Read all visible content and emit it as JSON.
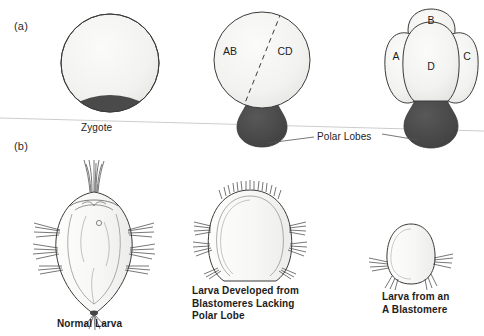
{
  "figure": {
    "panels": [
      {
        "id": "a",
        "label": "(a)"
      },
      {
        "id": "b",
        "label": "(b)"
      }
    ],
    "panel_a": {
      "stages": [
        {
          "name": "zygote",
          "caption": "Zygote",
          "cell_labels": [],
          "has_polar_lobe": true,
          "polar_lobe_style": "crescent"
        },
        {
          "name": "two-cell-stage",
          "caption": "",
          "cell_labels": [
            "AB",
            "CD"
          ],
          "has_polar_lobe": true,
          "polar_lobe_style": "lobe",
          "cleavage_furrow": "dashed"
        },
        {
          "name": "four-cell-stage",
          "caption": "",
          "cell_labels": [
            "A",
            "B",
            "C",
            "D"
          ],
          "has_polar_lobe": true,
          "polar_lobe_style": "lobe"
        }
      ],
      "annotation": {
        "text": "Polar Lobes",
        "leader_lines": 2
      }
    },
    "panel_b": {
      "larvae": [
        {
          "name": "normal-larva",
          "caption": "Normal Larva",
          "features": [
            "apical-tuft",
            "lateral-bristles",
            "posterior-tuft",
            "internal-organs",
            "eye-spot"
          ]
        },
        {
          "name": "larva-lacking-polar-lobe",
          "caption": "Larva Developed from\nBlastomeres Lacking\nPolar Lobe",
          "features": [
            "short-apical-cilia",
            "lateral-bristles"
          ]
        },
        {
          "name": "larva-from-a-blastomere",
          "caption": "Larva from an\nA Blastomere",
          "features": [
            "lateral-bristles"
          ]
        }
      ]
    },
    "colors": {
      "polar_lobe_fill": "#4a4a4a",
      "cell_fill": "#f4f4f2",
      "outline": "#3a3a3a",
      "scan_line": "#c9c9c9",
      "text": "#1d1d1d"
    }
  }
}
